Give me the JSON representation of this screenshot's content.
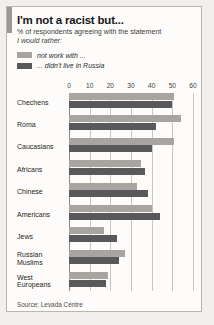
{
  "card": {
    "title": "I'm not a racist but...",
    "subtitle": "% of respondents agreeing with the statement",
    "subtitle_italic": "I would rather:",
    "source": "Source: Levada Centre"
  },
  "legend": {
    "items": [
      {
        "label": "not work with ...",
        "color": "#a8a5a0",
        "name": "legend-swatch-not-work-with"
      },
      {
        "label": "... didn't live in Russia",
        "color": "#59585a",
        "name": "legend-swatch-didnt-live-in-russia"
      }
    ]
  },
  "chart_data": {
    "type": "bar",
    "orientation": "horizontal",
    "title": "I'm not a racist but...",
    "subtitle": "% of respondents agreeing with the statement I would rather:",
    "xlabel": "",
    "ylabel": "",
    "xlim": [
      0,
      60
    ],
    "xticks": [
      0,
      10,
      20,
      30,
      40,
      50,
      60
    ],
    "xtick_labels": [
      "0",
      "10",
      "20",
      "30",
      "40",
      "50",
      "60"
    ],
    "grid": true,
    "legend_position": "top-left",
    "categories": [
      "Chechens",
      "Roma",
      "Caucasians",
      "Africans",
      "Chinese",
      "Americans",
      "Jews",
      "Russian Muslims",
      "West Europeans"
    ],
    "series": [
      {
        "name": "not work with ...",
        "color": "#a8a5a0",
        "values": [
          51,
          54,
          51,
          35,
          33,
          40,
          17,
          27,
          19
        ]
      },
      {
        "name": "... didn't live in Russia",
        "color": "#59585a",
        "values": [
          50,
          42,
          40,
          37,
          38,
          44,
          23,
          24,
          18
        ]
      }
    ],
    "source": "Source: Levada Centre"
  }
}
